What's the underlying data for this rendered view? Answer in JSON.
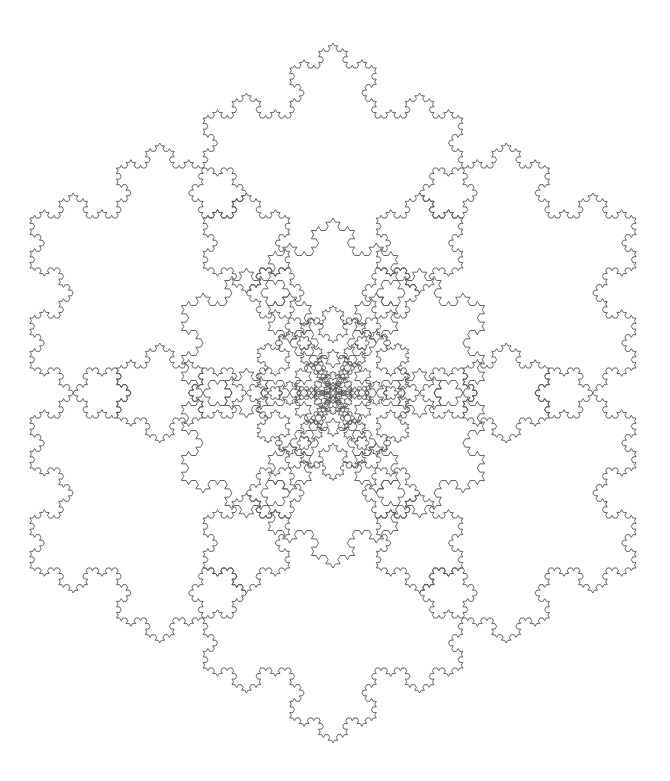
{
  "figure": {
    "background": "#ffffff",
    "stroke_color": "#555555",
    "stroke_width": 0.9,
    "center": [
      333,
      393
    ],
    "rings": [
      {
        "count": 6,
        "distance": 200,
        "radius": 150,
        "rotation_deg": 90,
        "depth": 4
      },
      {
        "count": 6,
        "distance": 100,
        "radius": 75,
        "rotation_deg": 90,
        "depth": 3
      },
      {
        "count": 6,
        "distance": 50,
        "radius": 37.5,
        "rotation_deg": 90,
        "depth": 3
      },
      {
        "count": 6,
        "distance": 25,
        "radius": 18.75,
        "rotation_deg": 90,
        "depth": 2
      },
      {
        "count": 6,
        "distance": 12.5,
        "radius": 9.4,
        "rotation_deg": 90,
        "depth": 2
      },
      {
        "count": 6,
        "distance": 6.25,
        "radius": 4.7,
        "rotation_deg": 90,
        "depth": 1
      }
    ]
  }
}
